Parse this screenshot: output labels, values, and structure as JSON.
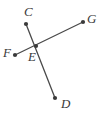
{
  "figure": {
    "type": "geometry-diagram",
    "width": 104,
    "height": 115,
    "background_color": "#ffffff",
    "line_color": "#4a4a4a",
    "point_color": "#3a3a3a",
    "label_color": "#3a3a3a",
    "points": [
      {
        "id": "C",
        "label": "C",
        "x": 26,
        "y": 24,
        "label_x": 24,
        "label_y": 5
      },
      {
        "id": "G",
        "label": "G",
        "x": 83,
        "y": 22,
        "label_x": 87,
        "label_y": 12
      },
      {
        "id": "F",
        "label": "F",
        "x": 15,
        "y": 55,
        "label_x": 3,
        "label_y": 46
      },
      {
        "id": "E",
        "label": "E",
        "x": 36,
        "y": 46,
        "label_x": 28,
        "label_y": 50
      },
      {
        "id": "D",
        "label": "D",
        "x": 55,
        "y": 98,
        "label_x": 61,
        "label_y": 97
      }
    ],
    "segments": [
      {
        "id": "CD",
        "from": "C",
        "to": "D",
        "through": "E"
      },
      {
        "id": "FG",
        "from": "F",
        "to": "G",
        "through": "E"
      }
    ],
    "labels": {
      "C": "C",
      "G": "G",
      "F": "F",
      "E": "E",
      "D": "D"
    }
  }
}
